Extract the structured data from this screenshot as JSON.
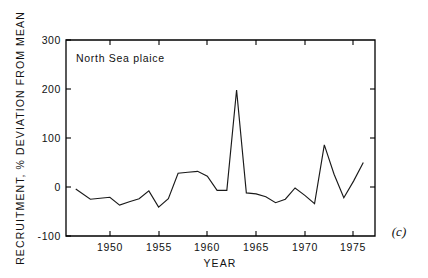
{
  "chart_data": {
    "type": "line",
    "title": "",
    "series_label": "North Sea plaice",
    "panel_label": "(c)",
    "xlabel": "YEAR",
    "ylabel": "RECRUITMENT, % DEVIATION FROM MEAN",
    "xlim": [
      1945.5,
      1977.2
    ],
    "ylim": [
      -100,
      300
    ],
    "xticks": [
      1950,
      1955,
      1960,
      1965,
      1970,
      1975
    ],
    "xtick_labels": [
      "1950",
      "1955",
      "1960",
      "1965",
      "1970",
      "1975"
    ],
    "yticks": [
      -100,
      0,
      100,
      200,
      300
    ],
    "ytick_labels": [
      "-100",
      "0",
      "100",
      "200",
      "300"
    ],
    "grid": false,
    "legend": "none",
    "line_color": "#1a1a1a",
    "x": [
      1946.5,
      1948,
      1949,
      1950,
      1951,
      1952,
      1953,
      1954,
      1955,
      1956,
      1957,
      1958,
      1959,
      1960,
      1961,
      1962,
      1963,
      1964,
      1965,
      1966,
      1967,
      1968,
      1969,
      1970,
      1971,
      1972,
      1973,
      1974,
      1975,
      1976
    ],
    "values": [
      -4,
      -25,
      -23,
      -21,
      -37,
      -30,
      -24,
      -8,
      -41,
      -24,
      28,
      30,
      32,
      22,
      -7,
      -7,
      198,
      -12,
      -14,
      -20,
      -32,
      -25,
      -2,
      -17,
      -34,
      86,
      26,
      -22,
      12,
      50
    ],
    "series": [
      {
        "name": "North Sea plaice",
        "values": [
          -4,
          -25,
          -23,
          -21,
          -37,
          -30,
          -24,
          -8,
          -41,
          -24,
          28,
          30,
          32,
          22,
          -7,
          -7,
          198,
          -12,
          -14,
          -20,
          -32,
          -25,
          -2,
          -17,
          -34,
          86,
          26,
          -22,
          12,
          50
        ]
      }
    ]
  },
  "axes": {
    "y_title": "RECRUITMENT, % DEVIATION FROM MEAN",
    "x_title": "YEAR",
    "y_labels": [
      "300",
      "200",
      "100",
      "0",
      "-100"
    ],
    "x_labels": [
      "1950",
      "1955",
      "1960",
      "1965",
      "1970",
      "1975"
    ]
  },
  "annotations": {
    "series_label": "North Sea plaice",
    "panel_label": "(c)"
  }
}
